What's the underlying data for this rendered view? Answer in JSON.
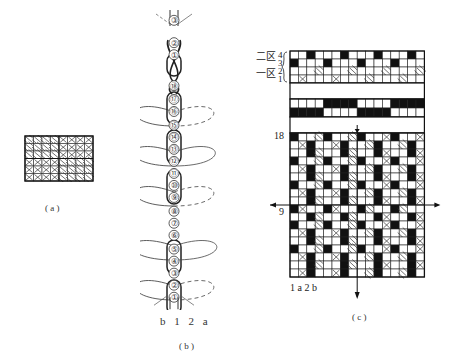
{
  "figure_a": {
    "caption": "( a )",
    "cols": 8,
    "rows": 6,
    "blocks": [
      {
        "pos": "top-left",
        "fill": "D"
      },
      {
        "pos": "top-right",
        "fill": "X"
      },
      {
        "pos": "bottom-left",
        "fill": "X"
      },
      {
        "pos": "bottom-right",
        "fill": "D"
      }
    ]
  },
  "figure_b": {
    "caption": "( b )",
    "bottom_labels": [
      "b",
      "1",
      "2",
      "a"
    ],
    "nodes": [
      "③",
      "②",
      "①",
      "⑱",
      "⑰",
      "⑯",
      "⑮",
      "⑭",
      "⑬",
      "⑫",
      "⑪",
      "⑩",
      "⑨",
      "⑧",
      "⑦",
      "⑥",
      "⑤",
      "④",
      "③",
      "②",
      "①"
    ]
  },
  "figure_c": {
    "caption": "( c )",
    "zone_labels": [
      {
        "text": "二区",
        "rows": [
          "4",
          "3"
        ]
      },
      {
        "text": "一区",
        "rows": [
          "2",
          "1"
        ]
      }
    ],
    "row_label_top": "18",
    "row_label_mid": "9",
    "bottom_labels": "1 a 2 b",
    "cols": 16,
    "header_rows": [
      "WWBWWWBWWWBWWWBW",
      "BWWWBWWWBWWWBWWW",
      "WWWDWWWDWWWDWWWD",
      "WXWWWXWWWDWWWDWW"
    ],
    "tieup_rows": [
      "WWWWBBBBWWWWBBBB",
      "BBBBWWWWBBBBWWWW"
    ],
    "main_rows": [
      "BWWDBWWDBWWXBWWX",
      "WXBWWXBWWDBWWDBW",
      "WWBDWWBDWWBXWWBX",
      "BWWDBWWDBWWXBWWX",
      "WXBWWXBWWDBWWDBW",
      "WWBDWWBDWWBXWWBX",
      "BWWDBWWDBWWXBWWX",
      "WXBWWXBWWDBWWDBW",
      "WWBDWWBDWWBXWWBX",
      "BXWWBXWWBDWWBDWW",
      "WWBDWWBDWWBXWWBX",
      "BWWDBWWDBWWXBWWX",
      "WXBWWXBWWDBWWDBW",
      "WWBDWWBDWWBXWWBX",
      "BWWDBWWDBWWXBWWX",
      "WXBWWXBWWDBWWDBW",
      "WWBDWWBDWWBXWWBX",
      "WXBWWXBWWDBWWDBW"
    ]
  }
}
